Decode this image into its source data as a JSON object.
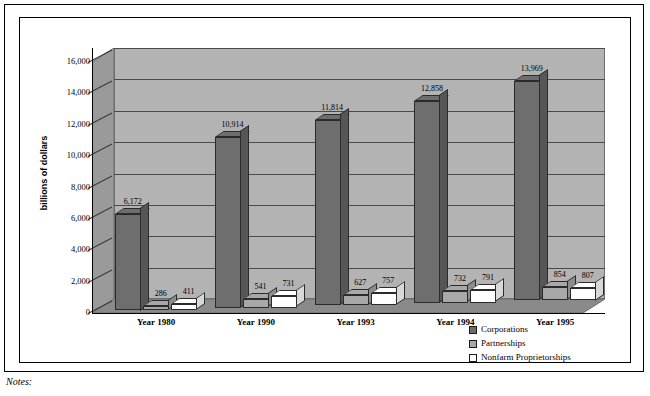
{
  "notes_label": "Notes:",
  "colors": {
    "corporations": "#6e6e6e",
    "partnerships": "#a8a8a8",
    "nonfarm": "#ffffff",
    "backwall": "#b3b3b3",
    "sidewall": "#9a9a9a",
    "floor": "#8a8a8a",
    "gridline": "#4a4a4a",
    "outline": "#2b2b2b"
  },
  "legend": {
    "items": [
      {
        "label": "Corporations",
        "color": "#6e6e6e"
      },
      {
        "label": "Partnerships",
        "color": "#a8a8a8"
      },
      {
        "label": "Nonfarm Proprietorships",
        "color": "#ffffff"
      }
    ]
  },
  "chart_data": {
    "type": "bar",
    "title": "",
    "xlabel": "",
    "ylabel": "billions of dollars",
    "ylim": [
      0,
      16000
    ],
    "yticks": [
      "0",
      "2,000",
      "4,000",
      "6,000",
      "8,000",
      "10,000",
      "12,000",
      "14,000",
      "16,000"
    ],
    "ytick_values": [
      0,
      2000,
      4000,
      6000,
      8000,
      10000,
      12000,
      14000,
      16000
    ],
    "grid": true,
    "legend_position": "bottom-right",
    "categories": [
      "Year 1980",
      "Year 1990",
      "Year 1993",
      "Year 1994",
      "Year 1995"
    ],
    "series": [
      {
        "name": "Corporations",
        "values": [
          6172,
          10914,
          11814,
          12858,
          13969
        ],
        "labels": [
          "6,172",
          "10,914",
          "11,814",
          "12,858",
          "13,969"
        ]
      },
      {
        "name": "Partnerships",
        "values": [
          286,
          541,
          627,
          732,
          854
        ],
        "labels": [
          "286",
          "541",
          "627",
          "732",
          "854"
        ]
      },
      {
        "name": "Nonfarm Proprietorships",
        "values": [
          411,
          731,
          757,
          791,
          807
        ],
        "labels": [
          "411",
          "731",
          "757",
          "791",
          "807"
        ]
      }
    ]
  }
}
